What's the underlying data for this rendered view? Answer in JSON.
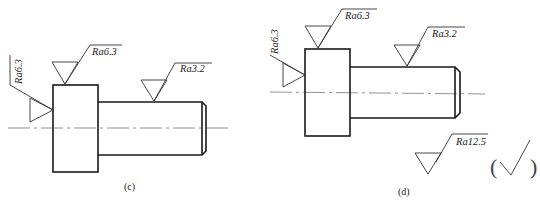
{
  "figures": [
    {
      "caption": "(c)",
      "labels": {
        "left_face": "Ra6.3",
        "top_face": "Ra6.3",
        "shaft": "Ra3.2"
      }
    },
    {
      "caption": "(d)",
      "labels": {
        "left_face": "Ra6.3",
        "top_face": "Ra6.3",
        "shaft": "Ra3.2",
        "general": "Ra12.5"
      },
      "mark": {
        "open": "(",
        "close": ")"
      }
    }
  ]
}
